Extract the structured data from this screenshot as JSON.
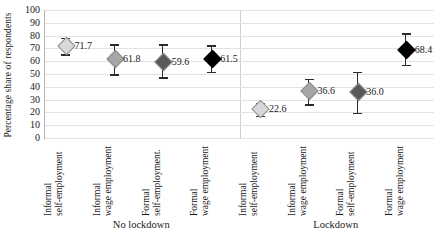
{
  "chart_data": {
    "type": "scatter",
    "title": "",
    "xlabel": "",
    "ylabel": "Percentage share of respondents",
    "ylim": [
      0,
      100
    ],
    "ytick_step": 10,
    "ytick_labels": [
      "100",
      "90",
      "80",
      "70",
      "60",
      "50",
      "40",
      "30",
      "20",
      "10",
      "0"
    ],
    "grid": true,
    "legend": "none",
    "group_labels": [
      "No lockdown",
      "Lockdown"
    ],
    "categories": [
      "Informal self-employment",
      "Informal wage employment",
      "Formal self-employment.",
      "Formal wage employment",
      "Informal self-employment",
      "Informal wage employment",
      "Formal self-employment",
      "Formal wage employment"
    ],
    "points": [
      {
        "group": "No lockdown",
        "category_line1": "Informal",
        "category_line2": "self-employment",
        "value": 71.7,
        "label": "71.7",
        "ci_low": 65.3,
        "ci_high": 78.2,
        "marker_color": "#d9d9d9"
      },
      {
        "group": "No lockdown",
        "category_line1": "Informal",
        "category_line2": "wage employment",
        "value": 61.8,
        "label": "61.8",
        "ci_low": 49.9,
        "ci_high": 73.3,
        "marker_color": "#a6a6a6"
      },
      {
        "group": "No lockdown",
        "category_line1": "Formal",
        "category_line2": "self-employment.",
        "value": 59.6,
        "label": "59.6",
        "ci_low": 47.3,
        "ci_high": 73.2,
        "marker_color": "#595959"
      },
      {
        "group": "No lockdown",
        "category_line1": "Formal",
        "category_line2": "wage employment",
        "value": 61.5,
        "label": "61.5",
        "ci_low": 51.7,
        "ci_high": 72.6,
        "marker_color": "#000000"
      },
      {
        "group": "Lockdown",
        "category_line1": "Informal",
        "category_line2": "self-employment",
        "value": 22.6,
        "label": "22.6",
        "ci_low": 17.3,
        "ci_high": 27.6,
        "marker_color": "#d9d9d9"
      },
      {
        "group": "Lockdown",
        "category_line1": "Informal",
        "category_line2": "wage employment",
        "value": 36.6,
        "label": "36.6",
        "ci_low": 26.5,
        "ci_high": 46.4,
        "marker_color": "#a6a6a6"
      },
      {
        "group": "Lockdown",
        "category_line1": "Formal",
        "category_line2": "self-employment",
        "value": 36.0,
        "label": "36.0",
        "ci_low": 19.7,
        "ci_high": 51.8,
        "marker_color": "#595959"
      },
      {
        "group": "Lockdown",
        "category_line1": "Formal",
        "category_line2": "wage employment",
        "value": 68.4,
        "label": "68.4",
        "ci_low": 57.2,
        "ci_high": 82.0,
        "marker_color": "#000000"
      }
    ]
  }
}
